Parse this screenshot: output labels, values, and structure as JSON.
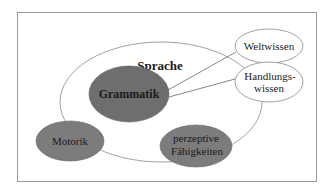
{
  "diagram": {
    "container": {
      "label": "Sprache"
    },
    "core": {
      "label": "Grammatik"
    },
    "nodes": {
      "motorik": {
        "label": "Motorik"
      },
      "perzeptive": {
        "line1": "perzeptive",
        "line2": "Fähigkeiten"
      },
      "weltwissen": {
        "label": "Weltwissen"
      },
      "handlungswissen": {
        "line1": "Handlungs-",
        "line2": "wissen"
      }
    },
    "colors": {
      "frame": "#9a9a9a",
      "outline": "#8a8a8a",
      "dark_fill": "#6e6e6e",
      "mid_fill": "#7c7c7c",
      "text": "#1a1a1a",
      "background": "#ffffff"
    }
  }
}
